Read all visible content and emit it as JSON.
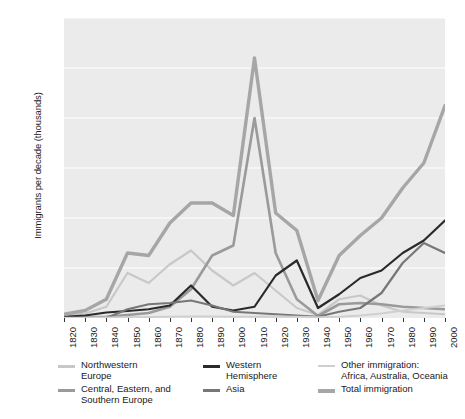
{
  "chart_data": {
    "type": "line",
    "title": "",
    "xlabel": "",
    "ylabel": "Immigrants per decade\n(thousands)",
    "xlim": [
      1820,
      2000
    ],
    "ylim": [
      0,
      1200
    ],
    "ytick_values": [
      0,
      200,
      400,
      600,
      800,
      1000,
      1200
    ],
    "ytick_labels": [
      "0",
      "200",
      "400",
      "600",
      "800",
      "1,000",
      "1,200"
    ],
    "grid": "horizontal-white",
    "legend_position": "below-plot",
    "plot_background": "#ebebeb",
    "x": [
      1820,
      1830,
      1840,
      1850,
      1860,
      1870,
      1880,
      1890,
      1900,
      1910,
      1920,
      1930,
      1940,
      1950,
      1960,
      1970,
      1980,
      1990,
      2000
    ],
    "categories": [
      "1820",
      "1830",
      "1840",
      "1850",
      "1860",
      "1870",
      "1880",
      "1890",
      "1900",
      "1910",
      "1920",
      "1930",
      "1940",
      "1950",
      "1960",
      "1970",
      "1980",
      "1990",
      "2000"
    ],
    "series": [
      {
        "name": "Northwestern Europe",
        "color": "#c8c8c8",
        "width": 2.2,
        "values": [
          8,
          18,
          45,
          180,
          140,
          215,
          270,
          190,
          130,
          180,
          110,
          40,
          12,
          75,
          90,
          50,
          25,
          20,
          15
        ]
      },
      {
        "name": "Central, Eastern, and Southern Europe",
        "color": "#9a9a9a",
        "width": 2.6,
        "values": [
          2,
          3,
          5,
          12,
          20,
          45,
          115,
          250,
          290,
          800,
          260,
          75,
          8,
          55,
          60,
          55,
          45,
          40,
          35
        ]
      },
      {
        "name": "Western Hemisphere",
        "color": "#2a2a2a",
        "width": 2.2,
        "values": [
          5,
          10,
          22,
          28,
          35,
          50,
          130,
          45,
          30,
          45,
          170,
          230,
          40,
          95,
          160,
          190,
          260,
          310,
          390
        ]
      },
      {
        "name": "Asia",
        "color": "#777777",
        "width": 2.2,
        "values": [
          0,
          0,
          0,
          35,
          55,
          60,
          70,
          50,
          25,
          20,
          15,
          10,
          5,
          25,
          40,
          100,
          220,
          300,
          260
        ]
      },
      {
        "name": "Other immigration: Africa, Australia, Oceania",
        "color": "#cfcfcf",
        "width": 1.8,
        "values": [
          1,
          1,
          2,
          3,
          4,
          5,
          6,
          6,
          5,
          5,
          6,
          5,
          3,
          5,
          10,
          18,
          30,
          40,
          50
        ]
      },
      {
        "name": "Total immigration",
        "color": "#a6a6a6",
        "width": 3.4,
        "values": [
          15,
          30,
          75,
          260,
          250,
          380,
          460,
          460,
          410,
          1040,
          420,
          350,
          70,
          250,
          330,
          400,
          520,
          620,
          850
        ]
      }
    ],
    "legend": [
      {
        "label": "Northwestern\nEurope",
        "color": "#c8c8c8",
        "thickness": 2.5
      },
      {
        "label": "Central, Eastern, and\nSouthern Europe",
        "color": "#9a9a9a",
        "thickness": 2.8
      },
      {
        "label": "Western\nHemisphere",
        "color": "#2a2a2a",
        "thickness": 2.8
      },
      {
        "label": "Asia",
        "color": "#777777",
        "thickness": 2.8
      },
      {
        "label": "Other immigration:\nAfrica, Australia, Oceania",
        "color": "#cfcfcf",
        "thickness": 2.2
      },
      {
        "label": "Total immigration",
        "color": "#a6a6a6",
        "thickness": 4.2
      }
    ]
  }
}
